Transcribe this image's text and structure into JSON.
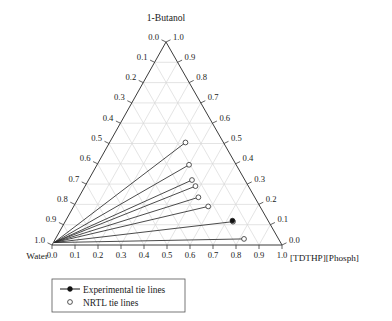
{
  "chart_data": {
    "type": "scatter",
    "subtype": "ternary-phase-diagram",
    "title": "1-Butanol",
    "vertices": {
      "top": "1-Butanol",
      "left": "Water",
      "right": "[TDTHP][Phosph]"
    },
    "axes": {
      "left": {
        "label": "1-Butanol fraction",
        "ticks": [
          "0.0",
          "0.1",
          "0.2",
          "0.3",
          "0.4",
          "0.5",
          "0.6",
          "0.7",
          "0.8",
          "0.9",
          "1.0"
        ],
        "direction": "top-to-bottom"
      },
      "right": {
        "label": "[TDTHP][Phosph] axis",
        "ticks": [
          "1.0",
          "0.9",
          "0.8",
          "0.7",
          "0.6",
          "0.5",
          "0.4",
          "0.3",
          "0.2",
          "0.1",
          "0.0"
        ],
        "direction": "top-to-bottom"
      },
      "bottom": {
        "label": "Water to [TDTHP][Phosph]",
        "ticks": [
          "0.0",
          "0.1",
          "0.2",
          "0.3",
          "0.4",
          "0.5",
          "0.6",
          "0.7",
          "0.8",
          "0.9",
          "1.0"
        ],
        "direction": "left-to-right"
      }
    },
    "grid": true,
    "grid_interval": 0.1,
    "tie_lines": [
      {
        "id": 1,
        "water_end": [
          0.985,
          0.012,
          0.003
        ],
        "organic_end": [
          0.165,
          0.505,
          0.33
        ]
      },
      {
        "id": 2,
        "water_end": [
          0.985,
          0.012,
          0.003
        ],
        "organic_end": [
          0.205,
          0.395,
          0.4
        ]
      },
      {
        "id": 3,
        "water_end": [
          0.985,
          0.012,
          0.003
        ],
        "organic_end": [
          0.23,
          0.32,
          0.45
        ]
      },
      {
        "id": 4,
        "water_end": [
          0.985,
          0.012,
          0.003
        ],
        "organic_end": [
          0.23,
          0.29,
          0.48
        ]
      },
      {
        "id": 5,
        "water_end": [
          0.985,
          0.012,
          0.003
        ],
        "organic_end": [
          0.245,
          0.235,
          0.52
        ]
      },
      {
        "id": 6,
        "water_end": [
          0.985,
          0.012,
          0.003
        ],
        "organic_end": [
          0.225,
          0.19,
          0.585
        ]
      },
      {
        "id": 7,
        "water_end": [
          0.985,
          0.012,
          0.003
        ],
        "organic_end": [
          0.155,
          0.115,
          0.73
        ]
      },
      {
        "id": 8,
        "water_end": [
          0.985,
          0.012,
          0.003
        ],
        "organic_end": [
          0.15,
          0.03,
          0.82
        ]
      }
    ],
    "experimental_points": [
      {
        "tie_line": 7,
        "composition": [
          0.155,
          0.12,
          0.725
        ]
      }
    ],
    "series": [
      {
        "name": "Experimental tie lines",
        "marker": "filled-circle",
        "line": "solid"
      },
      {
        "name": "NRTL tie lines",
        "marker": "open-circle",
        "line": "none"
      }
    ],
    "legend_position": "bottom-left"
  },
  "title": {
    "text": "1-Butanol"
  },
  "vertex_labels": {
    "left": "Water",
    "right": "[TDTHP][Phosph]"
  },
  "left_axis_ticks": [
    "0.0",
    "0.1",
    "0.2",
    "0.3",
    "0.4",
    "0.5",
    "0.6",
    "0.7",
    "0.8",
    "0.9",
    "1.0"
  ],
  "right_axis_ticks": [
    "1.0",
    "0.9",
    "0.8",
    "0.7",
    "0.6",
    "0.5",
    "0.4",
    "0.3",
    "0.2",
    "0.1",
    "0.0"
  ],
  "bottom_axis_ticks": [
    "0.0",
    "0.1",
    "0.2",
    "0.3",
    "0.4",
    "0.5",
    "0.6",
    "0.7",
    "0.8",
    "0.9",
    "1.0"
  ],
  "legend": {
    "items": [
      {
        "label": "Experimental tie lines",
        "marker": "filled-circle"
      },
      {
        "label": "NRTL tie lines",
        "marker": "open-circle"
      }
    ]
  },
  "colors": {
    "axis": "#3b3b3b",
    "grid": "#d9d9d9",
    "tie_line": "#2b2b2b",
    "marker_fill": "#111111",
    "background": "#ffffff"
  }
}
